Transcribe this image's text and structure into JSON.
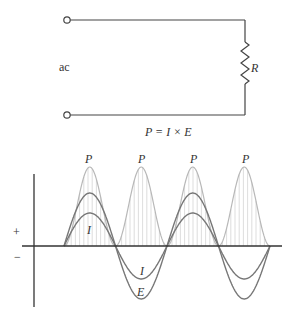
{
  "circuit": {
    "source_label": "ac",
    "resistor_label": "R",
    "formula": "P = I × E"
  },
  "graph": {
    "plus_label": "+",
    "minus_label": "−",
    "power_labels": [
      "P",
      "P",
      "P",
      "P"
    ],
    "current_label_pos": "I",
    "current_label_neg": "I",
    "voltage_label_neg": "E"
  },
  "colors": {
    "wire": "#444444",
    "power_curve": "#b8b8b8",
    "hatch": "#d4d4d4",
    "ei_curve": "#777777",
    "axis": "#333333"
  }
}
